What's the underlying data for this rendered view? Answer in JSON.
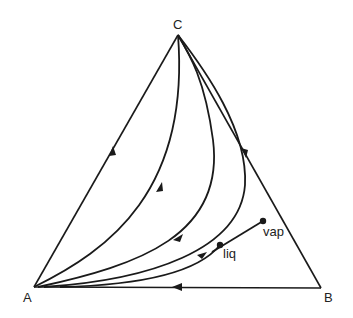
{
  "diagram": {
    "type": "ternary residue curve map",
    "vertices": {
      "A": {
        "label": "A",
        "x": 34,
        "y": 287
      },
      "B": {
        "label": "B",
        "x": 321,
        "y": 288
      },
      "C": {
        "label": "C",
        "x": 178,
        "y": 35
      }
    },
    "points": {
      "liq": {
        "label": "liq",
        "x": 220,
        "y": 245
      },
      "vap": {
        "label": "vap",
        "x": 263,
        "y": 221
      }
    },
    "residue_curves": [
      {
        "name": "curve-1",
        "from": "A",
        "to": "C"
      },
      {
        "name": "curve-2",
        "from": "A",
        "to": "C"
      },
      {
        "name": "curve-3",
        "from": "A",
        "to": "C"
      },
      {
        "name": "curve-4",
        "from": "A",
        "to": "C"
      }
    ],
    "tie_line": {
      "from": "liq",
      "to": "vap"
    },
    "colors": {
      "line": "#1a1a1a",
      "background": "#ffffff"
    }
  }
}
